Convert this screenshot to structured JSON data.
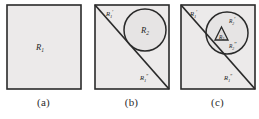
{
  "figure": {
    "type": "region-subdivision-diagram",
    "background_color": "#ffffff",
    "region_fill_color": "#eceaea",
    "line_color": "#2a2a2a",
    "panel_count": 3
  },
  "panels": [
    {
      "id": "a",
      "caption": "(a)",
      "shapes": [
        "square"
      ],
      "labels": [
        {
          "name": "region-r1",
          "base": "R",
          "sub": "1",
          "prime": ""
        }
      ]
    },
    {
      "id": "b",
      "caption": "(b)",
      "shapes": [
        "square",
        "diagonal",
        "circle"
      ],
      "labels": [
        {
          "name": "region-r1-prime",
          "base": "R",
          "sub": "1",
          "prime": "′"
        },
        {
          "name": "region-r1-double-prime",
          "base": "R",
          "sub": "1",
          "prime": "″"
        },
        {
          "name": "region-r2",
          "base": "R",
          "sub": "2",
          "prime": ""
        }
      ]
    },
    {
      "id": "c",
      "caption": "(c)",
      "shapes": [
        "square",
        "diagonal",
        "circle",
        "triangle"
      ],
      "labels": [
        {
          "name": "region-r1-prime",
          "base": "R",
          "sub": "1",
          "prime": "′"
        },
        {
          "name": "region-r1-double-prime",
          "base": "R",
          "sub": "1",
          "prime": "″"
        },
        {
          "name": "region-r2-prime",
          "base": "R",
          "sub": "2",
          "prime": "′"
        },
        {
          "name": "region-r2-double-prime",
          "base": "R",
          "sub": "2",
          "prime": "″"
        },
        {
          "name": "region-r3",
          "base": "R",
          "sub": "3",
          "prime": ""
        }
      ]
    }
  ],
  "text": {
    "R": "R",
    "sub1": "1",
    "sub2": "2",
    "sub3": "3",
    "prime": "′",
    "double_prime": "″",
    "caption_a": "(a)",
    "caption_b": "(b)",
    "caption_c": "(c)"
  }
}
